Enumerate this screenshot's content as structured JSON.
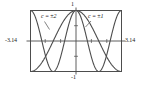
{
  "figure": {
    "name": "cosine-family-plot",
    "background_color": "#ffffff",
    "line_color": "#4d4d4d",
    "frame_color": "#4d4d4d",
    "axis_color": "#4d4d4d"
  },
  "labels": {
    "top": "1",
    "bottom": "-1",
    "left": "-3.14",
    "right": "3.14",
    "curve_c2": "c = ±2",
    "curve_c1": "c = ±1"
  },
  "chart_data": {
    "type": "line",
    "title": "",
    "subtitle": "",
    "xlabel": "",
    "ylabel": "",
    "xlim": [
      -3.14,
      3.14
    ],
    "ylim": [
      -1,
      1
    ],
    "xticks": [
      -3.14,
      3.14
    ],
    "xticklabels": [
      "-3.14",
      "3.14"
    ],
    "yticks": [
      -1,
      1
    ],
    "yticklabels": [
      "-1",
      "1"
    ],
    "grid": false,
    "legend": "inline-annotations",
    "annotations": [
      {
        "text": "c = ±2",
        "series": "cos(2x)",
        "x": -1.75,
        "y": 0.86,
        "leader_to": {
          "x": -1.2,
          "y": 0.35
        }
      },
      {
        "text": "c = ±1",
        "series": "cos(x)",
        "x": 0.85,
        "y": 0.86,
        "leader_to": {
          "x": 0.45,
          "y": 0.42
        }
      }
    ],
    "series": [
      {
        "name": "cos(x)",
        "label": "c = ±1",
        "color": "#4d4d4d",
        "x": [
          -3.14,
          -2.95,
          -2.75,
          -2.55,
          -2.36,
          -2.16,
          -1.96,
          -1.77,
          -1.57,
          -1.37,
          -1.18,
          -0.98,
          -0.79,
          -0.59,
          -0.39,
          -0.2,
          0,
          0.2,
          0.39,
          0.59,
          0.79,
          0.98,
          1.18,
          1.37,
          1.57,
          1.77,
          1.96,
          2.16,
          2.36,
          2.55,
          2.75,
          2.95,
          3.14
        ],
        "y": [
          -1,
          -0.98,
          -0.92,
          -0.83,
          -0.71,
          -0.56,
          -0.38,
          -0.2,
          0,
          0.2,
          0.38,
          0.56,
          0.71,
          0.83,
          0.92,
          0.98,
          1,
          0.98,
          0.92,
          0.83,
          0.71,
          0.56,
          0.38,
          0.2,
          0,
          -0.2,
          -0.38,
          -0.56,
          -0.71,
          -0.83,
          -0.92,
          -0.98,
          -1
        ]
      },
      {
        "name": "cos(2x)",
        "label": "c = ±2",
        "color": "#4d4d4d",
        "x": [
          -3.14,
          -2.95,
          -2.75,
          -2.55,
          -2.36,
          -2.16,
          -1.96,
          -1.77,
          -1.57,
          -1.37,
          -1.18,
          -0.98,
          -0.79,
          -0.59,
          -0.39,
          -0.2,
          0,
          0.2,
          0.39,
          0.59,
          0.79,
          0.98,
          1.18,
          1.37,
          1.57,
          1.77,
          1.96,
          2.16,
          2.36,
          2.55,
          2.75,
          2.95,
          3.14
        ],
        "y": [
          1,
          0.92,
          0.71,
          0.38,
          0,
          -0.38,
          -0.71,
          -0.92,
          -1,
          -0.92,
          -0.71,
          -0.38,
          0,
          0.38,
          0.71,
          0.92,
          1,
          0.92,
          0.71,
          0.38,
          0,
          -0.38,
          -0.71,
          -0.92,
          -1,
          -0.92,
          -0.71,
          -0.38,
          0,
          0.38,
          0.71,
          0.92,
          1
        ]
      }
    ]
  }
}
